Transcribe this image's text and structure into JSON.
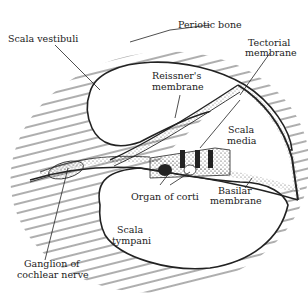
{
  "diagram": {
    "labels": {
      "periotic_bone": "Periotic bone",
      "scala_vestibuli": "Scala vestibuli",
      "tectorial_membrane": [
        "Tectorial",
        "membrane"
      ],
      "reissners_membrane": [
        "Reissner's",
        "membrane"
      ],
      "scala_media": [
        "Scala",
        "media"
      ],
      "organ_of_corti": "Organ of corti",
      "basilar_membrane": [
        "Basilar",
        "membrane"
      ],
      "scala_tympani": [
        "Scala",
        "tympani"
      ],
      "ganglion": [
        "Ganglion of",
        "cochlear nerve"
      ]
    },
    "colors": {
      "ink": "#222222",
      "background": "#ffffff",
      "hatch": "#333333"
    }
  }
}
